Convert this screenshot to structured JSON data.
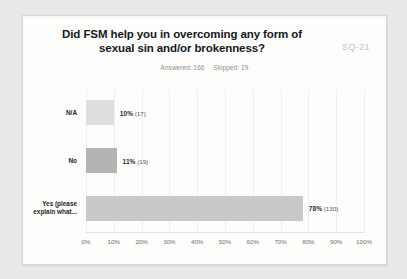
{
  "card": {
    "watermark": "SQ-21",
    "title": "Did FSM help you in overcoming any form of sexual sin and/or brokenness?",
    "answered_label": "Answered: 166",
    "skipped_label": "Skipped: 19"
  },
  "chart_data": {
    "type": "bar",
    "orientation": "horizontal",
    "title": "Did FSM help you in overcoming any form of sexual sin and/or brokenness?",
    "xlabel": "",
    "ylabel": "",
    "xlim": [
      0,
      100
    ],
    "grid": true,
    "legend": null,
    "answered": 166,
    "skipped": 19,
    "categories": [
      "N/A",
      "No",
      "Yes (please\nexplain what..."
    ],
    "values": [
      10,
      11,
      78
    ],
    "counts": [
      17,
      19,
      130
    ],
    "value_labels": [
      "10%",
      "11%",
      "78%"
    ],
    "count_labels": [
      "(17)",
      "(19)",
      "(130)"
    ],
    "bar_colors": [
      "#dedede",
      "#b4b4b4",
      "#c9c9c9"
    ],
    "tick_labels": [
      "0%",
      "10%",
      "20%",
      "30%",
      "40%",
      "50%",
      "60%",
      "70%",
      "80%",
      "90%",
      "100%"
    ],
    "tick_values": [
      0,
      10,
      20,
      30,
      40,
      50,
      60,
      70,
      80,
      90,
      100
    ]
  },
  "colors": {
    "page_background": "#e9e9e7",
    "card_background": "#fdfdfc",
    "title_text": "#14181c",
    "muted_text": "#8d8d8a",
    "grid": "#f0f0ee"
  }
}
